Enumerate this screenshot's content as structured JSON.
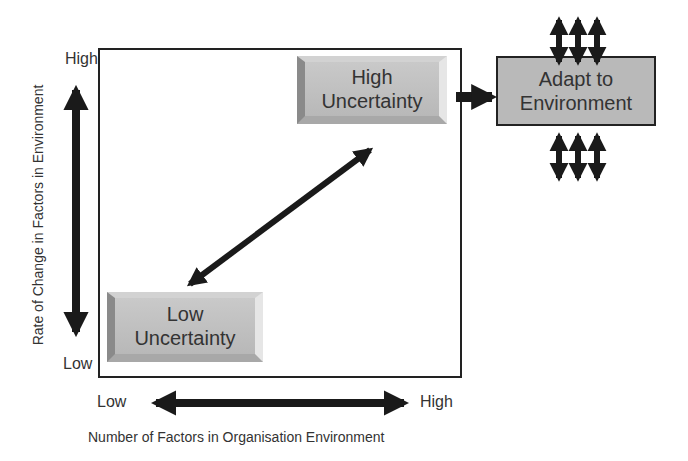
{
  "diagram": {
    "type": "2x2 uncertainty matrix",
    "y_axis": {
      "title": "Rate of Change in Factors in Environment",
      "high_label": "High",
      "low_label": "Low"
    },
    "x_axis": {
      "title": "Number of Factors in Organisation Environment",
      "low_label": "Low",
      "high_label": "High"
    },
    "boxes": {
      "high_uncertainty": {
        "line1": "High",
        "line2": "Uncertainty"
      },
      "low_uncertainty": {
        "line1": "Low",
        "line2": "Uncertainty"
      },
      "adapt": {
        "line1": "Adapt to",
        "line2": "Environment"
      }
    },
    "connections": [
      {
        "from": "low_uncertainty",
        "to": "high_uncertainty",
        "style": "double-arrow"
      },
      {
        "from": "high_uncertainty",
        "to": "adapt",
        "style": "arrow"
      }
    ],
    "colors": {
      "box_fill": "#b9b9b9",
      "arrow": "#1a1a1a",
      "frame": "#222222"
    }
  }
}
